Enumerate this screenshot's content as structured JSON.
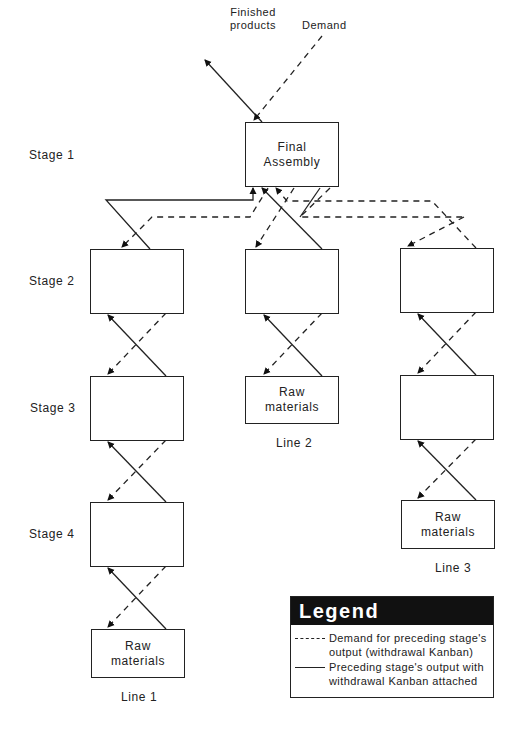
{
  "top": {
    "finished_products": "Finished products",
    "finished_products_line1": "Finished",
    "finished_products_line2": "products",
    "demand": "Demand"
  },
  "stages": [
    {
      "label": "Stage 1"
    },
    {
      "label": "Stage 2"
    },
    {
      "label": "Stage 3"
    },
    {
      "label": "Stage 4"
    }
  ],
  "final_assembly": {
    "line1": "Final",
    "line2": "Assembly"
  },
  "raw_materials": {
    "line1": "Raw",
    "line2": "materials"
  },
  "lines": [
    {
      "label": "Line 1",
      "stages": 3
    },
    {
      "label": "Line 2",
      "stages": 1
    },
    {
      "label": "Line 3",
      "stages": 2
    }
  ],
  "legend": {
    "title": "Legend",
    "items": [
      {
        "style": "dashed",
        "line1": "Demand for preceding stage's",
        "line2": "output (withdrawal Kanban)"
      },
      {
        "style": "solid",
        "line1": "Preceding stage's output with",
        "line2": "withdrawal Kanban attached"
      }
    ]
  },
  "colors": {
    "ink": "#222222",
    "legend_header": "#111111",
    "background": "#ffffff"
  }
}
